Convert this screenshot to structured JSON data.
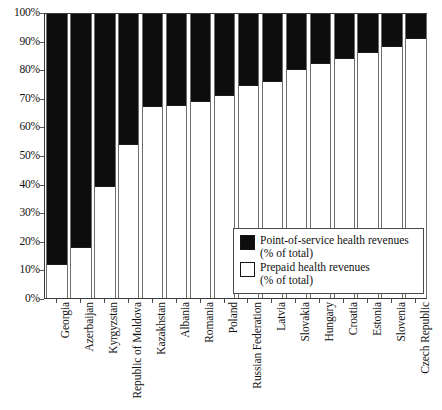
{
  "chart_data": {
    "type": "bar",
    "stacked": true,
    "title": "",
    "subtitle": "",
    "xlabel": "",
    "ylabel": "",
    "ylim": [
      0,
      100
    ],
    "ytick_labels": [
      "0%",
      "10%",
      "20%",
      "30%",
      "40%",
      "50%",
      "60%",
      "70%",
      "80%",
      "90%",
      "100%"
    ],
    "ytick_values": [
      0,
      10,
      20,
      30,
      40,
      50,
      60,
      70,
      80,
      90,
      100
    ],
    "grid": false,
    "legend_position": "inside-lower-right",
    "categories": [
      "Georgia",
      "Azerbaijan",
      "Kyrgyzstan",
      "Republic of Moldova",
      "Kazakhstan",
      "Albania",
      "Romania",
      "Poland",
      "Russian Federation",
      "Latvia",
      "Slovakia",
      "Hungary",
      "Croatia",
      "Estonia",
      "Slovenia",
      "Czech Republic"
    ],
    "series": [
      {
        "name": "Prepaid health revenues (% of total)",
        "color": "#ffffff",
        "values": [
          12,
          18,
          39,
          54,
          67,
          67.5,
          69,
          71,
          74.5,
          76,
          80,
          82,
          84,
          86,
          88,
          91
        ]
      },
      {
        "name": "Point-of-service health revenues (% of total)",
        "color": "#0d0d0d",
        "values": [
          88,
          82,
          61,
          46,
          33,
          32.5,
          31,
          29,
          25.5,
          24,
          20,
          18,
          16,
          14,
          12,
          9
        ]
      }
    ]
  },
  "legend": {
    "items": [
      {
        "swatch": "filled",
        "line1": "Point-of-service health revenues",
        "line2": "(% of total)"
      },
      {
        "swatch": "hollow",
        "line1": "Prepaid health revenues",
        "line2": "(% of total)"
      }
    ]
  }
}
